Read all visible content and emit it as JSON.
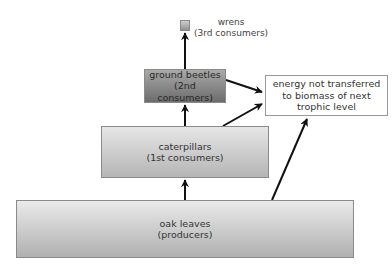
{
  "diagram": {
    "type": "energy-pyramid",
    "levels": [
      {
        "name": "oak leaves",
        "role": "(producers)"
      },
      {
        "name": "caterpillars",
        "role": "(1st consumers)"
      },
      {
        "name": "ground beetles",
        "role": "(2nd consumers)"
      },
      {
        "name": "wrens",
        "role": "(3rd consumers)"
      }
    ],
    "energy_loss": {
      "line1": "energy not transferred",
      "line2": "to biomass of next",
      "line3": "trophic level"
    },
    "colors": {
      "arrow": "#111111",
      "box_border": "#8a8a8a"
    }
  }
}
